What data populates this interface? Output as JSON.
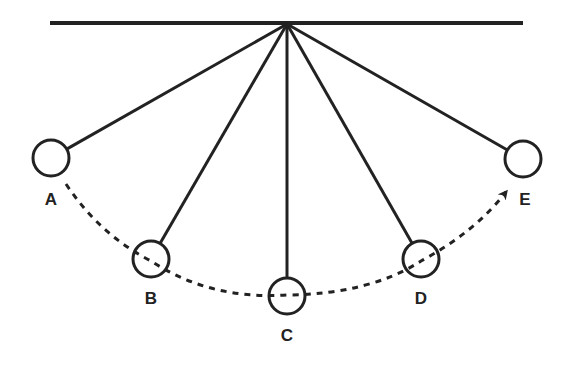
{
  "diagram": {
    "colors": {
      "line": "#222222",
      "background": "#ffffff"
    },
    "support_bar": {
      "x1": 50,
      "y1": 23,
      "x2": 523,
      "y2": 23
    },
    "pivot": {
      "x": 287,
      "y": 24
    },
    "bob_radius": 18,
    "bobs": [
      {
        "label": "A",
        "cx": 51,
        "cy": 158,
        "label_x": 51,
        "label_y": 201
      },
      {
        "label": "B",
        "cx": 151,
        "cy": 259,
        "label_x": 151,
        "label_y": 300
      },
      {
        "label": "C",
        "cx": 287,
        "cy": 296,
        "label_x": 287,
        "label_y": 337
      },
      {
        "label": "D",
        "cx": 421,
        "cy": 259,
        "label_x": 421,
        "label_y": 300
      },
      {
        "label": "E",
        "cx": 523,
        "cy": 159,
        "label_x": 525,
        "label_y": 201
      }
    ],
    "swing_path": {
      "style": "dashed",
      "direction": "A to E",
      "start": {
        "x": 66,
        "y": 184
      },
      "end": {
        "x": 506,
        "y": 192
      },
      "arrowhead": "end"
    }
  }
}
